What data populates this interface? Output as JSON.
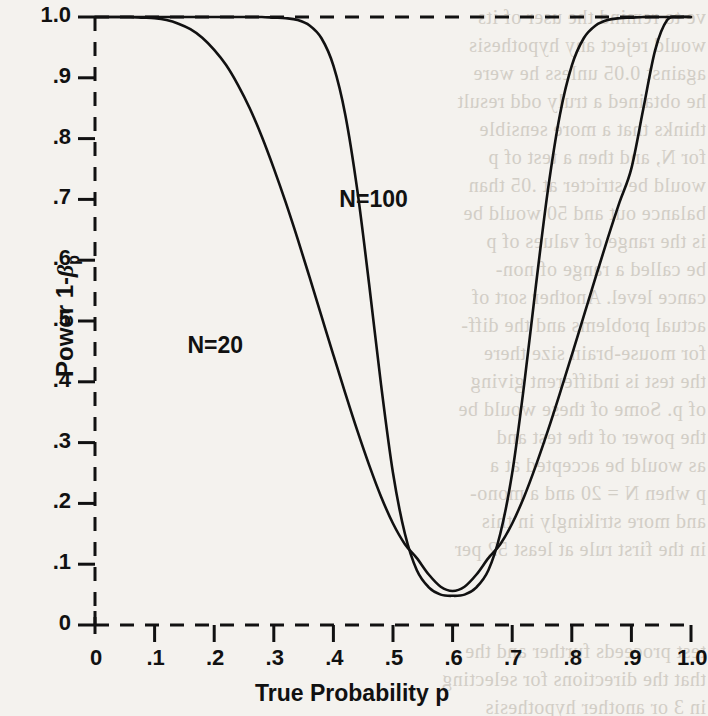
{
  "figure": {
    "background_color": "#f4f2ee",
    "ink_color": "#111111",
    "ghost_text_color": "#cdc8c0"
  },
  "chart_data": {
    "type": "line",
    "title": "",
    "xlabel": "True Probability p",
    "ylabel": "Power 1-βp",
    "ylabel_parts": {
      "prefix": "Power 1-",
      "symbol": "β",
      "subscript": "p"
    },
    "xlim": [
      0,
      1.0
    ],
    "ylim": [
      0,
      1.0
    ],
    "grid": false,
    "legend_position": "inline-annotation",
    "xticks": [
      0,
      0.1,
      0.2,
      0.3,
      0.4,
      0.5,
      0.6,
      0.7,
      0.8,
      0.9,
      1.0
    ],
    "xtick_labels": [
      "0",
      ".1",
      ".2",
      ".3",
      ".4",
      ".5",
      ".6",
      ".7",
      ".8",
      ".9",
      "1.0"
    ],
    "yticks": [
      0,
      0.1,
      0.2,
      0.3,
      0.4,
      0.5,
      0.6,
      0.7,
      0.8,
      0.9,
      1.0
    ],
    "ytick_labels": [
      "0",
      ".1",
      ".2",
      ".3",
      ".4",
      ".5",
      ".6",
      ".7",
      ".8",
      ".9",
      "1.0"
    ],
    "annotations": [
      {
        "text": "N=100",
        "x": 0.41,
        "y": 0.7
      },
      {
        "text": "N=20",
        "x": 0.155,
        "y": 0.46
      }
    ],
    "reference_lines": [
      {
        "orientation": "horizontal",
        "value": 1.0,
        "style": "dashed"
      },
      {
        "orientation": "horizontal",
        "value": 0.0,
        "style": "dashed"
      },
      {
        "orientation": "vertical",
        "value": 0.0,
        "style": "dashed"
      }
    ],
    "series": [
      {
        "name": "N=20",
        "x": [
          0.0,
          0.02,
          0.04,
          0.06,
          0.08,
          0.1,
          0.12,
          0.14,
          0.16,
          0.18,
          0.2,
          0.22,
          0.24,
          0.26,
          0.28,
          0.3,
          0.32,
          0.34,
          0.36,
          0.38,
          0.4,
          0.42,
          0.44,
          0.46,
          0.48,
          0.5,
          0.52,
          0.54,
          0.56,
          0.58,
          0.6,
          0.62,
          0.64,
          0.66,
          0.68,
          0.7,
          0.72,
          0.74,
          0.76,
          0.78,
          0.8,
          0.82,
          0.84,
          0.86,
          0.88,
          0.9,
          0.92,
          0.94,
          0.96,
          0.98,
          1.0
        ],
        "y": [
          1.0,
          1.0,
          1.0,
          1.0,
          0.999,
          0.998,
          0.995,
          0.989,
          0.98,
          0.966,
          0.946,
          0.921,
          0.888,
          0.849,
          0.803,
          0.751,
          0.695,
          0.635,
          0.572,
          0.508,
          0.444,
          0.381,
          0.32,
          0.263,
          0.211,
          0.167,
          0.133,
          0.11,
          0.083,
          0.063,
          0.056,
          0.063,
          0.083,
          0.11,
          0.133,
          0.167,
          0.211,
          0.263,
          0.32,
          0.381,
          0.444,
          0.508,
          0.572,
          0.635,
          0.695,
          0.751,
          0.849,
          0.946,
          0.995,
          1.0,
          1.0
        ]
      },
      {
        "name": "N=100",
        "x": [
          0.0,
          0.02,
          0.04,
          0.06,
          0.08,
          0.1,
          0.12,
          0.14,
          0.16,
          0.18,
          0.2,
          0.22,
          0.24,
          0.26,
          0.28,
          0.3,
          0.32,
          0.34,
          0.36,
          0.38,
          0.4,
          0.42,
          0.44,
          0.46,
          0.48,
          0.5,
          0.52,
          0.54,
          0.56,
          0.58,
          0.6,
          0.62,
          0.64,
          0.66,
          0.68,
          0.7,
          0.72,
          0.74,
          0.76,
          0.78,
          0.8,
          0.82,
          0.84,
          0.86,
          0.88,
          0.9,
          0.92,
          0.94,
          0.96,
          0.98,
          1.0
        ],
        "y": [
          1.0,
          1.0,
          1.0,
          1.0,
          1.0,
          1.0,
          1.0,
          1.0,
          1.0,
          1.0,
          1.0,
          1.0,
          1.0,
          1.0,
          1.0,
          0.999,
          0.998,
          0.995,
          0.986,
          0.965,
          0.92,
          0.839,
          0.716,
          0.56,
          0.395,
          0.25,
          0.15,
          0.09,
          0.062,
          0.05,
          0.048,
          0.05,
          0.062,
          0.09,
          0.15,
          0.25,
          0.395,
          0.56,
          0.716,
          0.839,
          0.92,
          0.965,
          0.986,
          0.995,
          0.998,
          0.999,
          1.0,
          1.0,
          1.0,
          1.0,
          1.0
        ]
      }
    ]
  },
  "ghost_text": {
    "lines": [
      "ve to remind the user of its",
      "would reject any hypothesis",
      "against 0.05 unless he were",
      "he obtained a truly odd result",
      "thinks that a more sensible",
      "for N, and then a test of p",
      "would be stricter at .05 than",
      "balance out and 50 would be",
      "is the range of values of p",
      "be called a range of non-",
      "cance level. Another sort of",
      "actual problems and the diff-",
      "for mouse-brain size there",
      "the test is indifferent giving",
      "of p. Some of these would be",
      "the power of the test and",
      "as would be accepted at a",
      "p when N = 20 and a mono-",
      "and more strikingly in this",
      "in the first rule at least 52 per",
      "test proceeds further and the",
      "that the directions for selecting",
      "in 3 or another hypothesis"
    ]
  }
}
